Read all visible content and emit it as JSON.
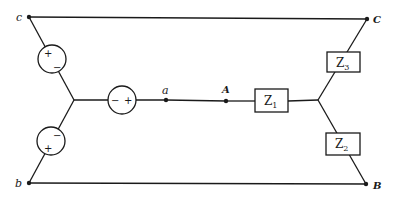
{
  "diagram": {
    "type": "three-phase Y-connected source and Y-connected load circuit",
    "source_nodes": {
      "c": "c",
      "b": "b",
      "a": "a"
    },
    "load_nodes": {
      "C": "C",
      "B": "B",
      "A": "A"
    },
    "sources": [
      {
        "id": "source-ca",
        "top_sign": "+",
        "bottom_sign": "−"
      },
      {
        "id": "source-ba",
        "top_sign": "−",
        "bottom_sign": "+"
      },
      {
        "id": "source-a",
        "left_sign": "−",
        "right_sign": "+"
      }
    ],
    "impedances": [
      {
        "id": "Z1",
        "symbol": "Z",
        "subscript": "1"
      },
      {
        "id": "Z2",
        "symbol": "Z",
        "subscript": "2"
      },
      {
        "id": "Z3",
        "symbol": "Z",
        "subscript": "3"
      }
    ],
    "colors": {
      "line": "#1a1a1a",
      "background": "#ffffff"
    }
  }
}
